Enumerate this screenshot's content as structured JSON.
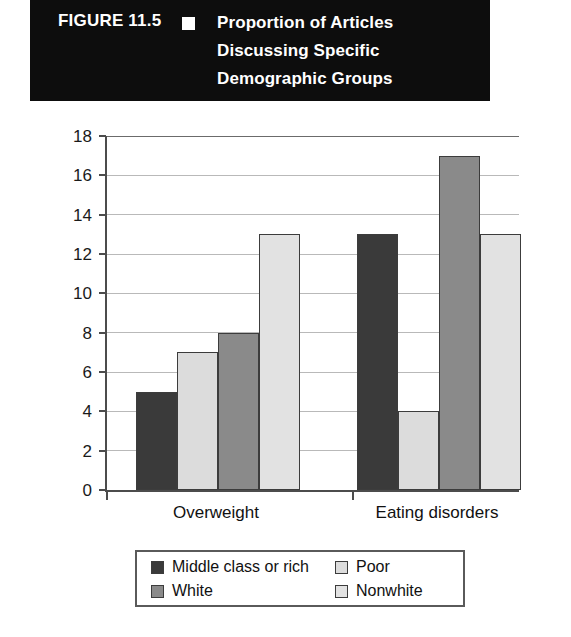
{
  "figure": {
    "number": "FIGURE 11.5",
    "bullet_icon": "square-bullet-icon",
    "title_lines": [
      "Proportion of Articles",
      "Discussing Specific",
      "Demographic Groups"
    ],
    "banner_background": "#0d0d0d",
    "banner_text_color": "#ffffff"
  },
  "chart_data": {
    "type": "bar",
    "title": "Proportion of Articles Discussing Specific Demographic Groups",
    "categories": [
      "Overweight",
      "Eating disorders"
    ],
    "series": [
      {
        "name": "Middle class or rich",
        "values": [
          5,
          13
        ],
        "color": "#3a3a3a"
      },
      {
        "name": "Poor",
        "values": [
          7,
          4
        ],
        "color": "#dcdcdc"
      },
      {
        "name": "White",
        "values": [
          8,
          17
        ],
        "color": "#8a8a8a"
      },
      {
        "name": "Nonwhite",
        "values": [
          13,
          13
        ],
        "color": "#e2e2e2"
      }
    ],
    "xlabel": "",
    "ylabel": "Percent",
    "ylim": [
      0,
      18
    ],
    "ytick_step": 2,
    "yticks": [
      "18",
      "16",
      "14",
      "12",
      "10",
      "8",
      "6",
      "4",
      "2",
      "0"
    ],
    "grid": true,
    "grid_color": "#b9b9b9",
    "legend_position": "bottom",
    "axis_color": "#4c4c4c"
  }
}
